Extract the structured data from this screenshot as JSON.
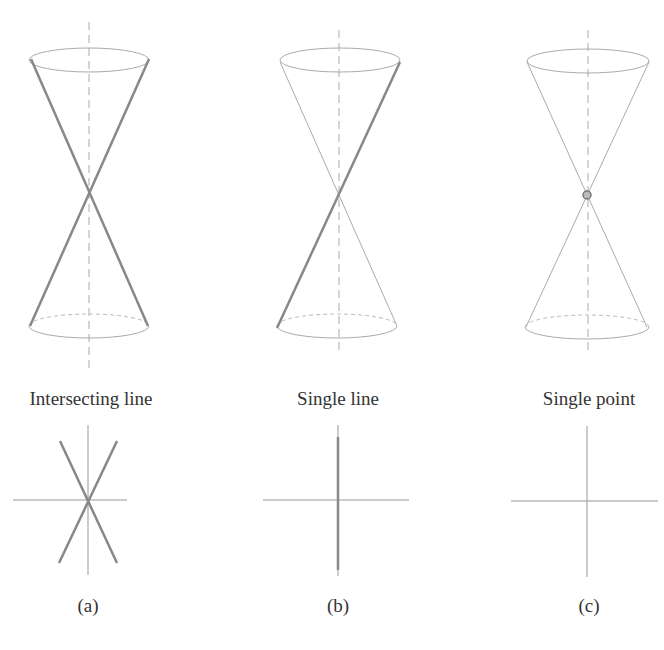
{
  "figure": {
    "panels": [
      {
        "id": "a",
        "title": "Intersecting line",
        "sublabel": "(a)",
        "cone": {
          "axis_x": 89,
          "top_y": 60,
          "apex_y": 193,
          "bottom_y": 326,
          "rx": 60,
          "ry": 12,
          "highlight": "two-lines"
        },
        "plot": {
          "cx": 69,
          "cy": 500,
          "half_w": 57,
          "half_h": 75,
          "lines": "two-crossing"
        }
      },
      {
        "id": "b",
        "title": "Single line",
        "sublabel": "(b)",
        "cone": {
          "axis_x": 339,
          "top_y": 60,
          "apex_y": 193,
          "bottom_y": 326,
          "rx": 60,
          "ry": 12,
          "highlight": "one-line"
        },
        "plot": {
          "cx": 338,
          "cy": 500,
          "half_w": 57,
          "half_h": 75,
          "lines": "single-vertical"
        }
      },
      {
        "id": "c",
        "title": "Single point",
        "sublabel": "(c)",
        "cone": {
          "axis_x": 588,
          "top_y": 60,
          "apex_y": 195,
          "bottom_y": 326,
          "rx": 61,
          "ry": 12,
          "highlight": "point"
        },
        "plot": {
          "cx": 588,
          "cy": 501,
          "half_w": 57,
          "half_h": 75,
          "lines": "none"
        }
      }
    ],
    "colors": {
      "thin": "#aaaaaa",
      "thick": "#888888",
      "axes": "#999999",
      "text": "#333333"
    }
  }
}
